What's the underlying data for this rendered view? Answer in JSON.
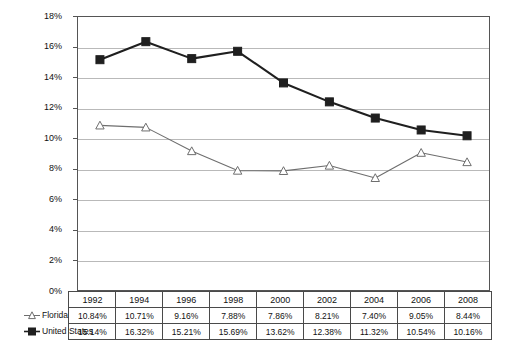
{
  "chart_data": {
    "type": "line",
    "title": "",
    "subtitle": "",
    "xlabel": "",
    "ylabel": "",
    "categories": [
      "1992",
      "1994",
      "1996",
      "1998",
      "2000",
      "2002",
      "2004",
      "2006",
      "2008"
    ],
    "series": [
      {
        "name": "Florida",
        "marker": "open-triangle",
        "color": "#6e6e6e",
        "values": [
          10.84,
          10.71,
          9.16,
          7.88,
          7.86,
          8.21,
          7.4,
          9.05,
          8.44
        ],
        "labels": [
          "10.84%",
          "10.71%",
          "9.16%",
          "7.88%",
          "7.86%",
          "8.21%",
          "7.40%",
          "9.05%",
          "8.44%"
        ]
      },
      {
        "name": "United States",
        "marker": "filled-square",
        "color": "#1f1f1f",
        "values": [
          15.14,
          16.32,
          15.21,
          15.69,
          13.62,
          12.38,
          11.32,
          10.54,
          10.16
        ],
        "labels": [
          "15.14%",
          "16.32%",
          "15.21%",
          "15.69%",
          "13.62%",
          "12.38%",
          "11.32%",
          "10.54%",
          "10.16%"
        ]
      }
    ],
    "ylim": [
      0,
      18
    ],
    "yticks": [
      0,
      2,
      4,
      6,
      8,
      10,
      12,
      14,
      16,
      18
    ],
    "ytick_labels": [
      "0%",
      "2%",
      "4%",
      "6%",
      "8%",
      "10%",
      "12%",
      "14%",
      "16%",
      "18%"
    ],
    "grid": true,
    "legend_position": "data-table-left",
    "value_suffix": "%"
  },
  "table": {
    "header_blank": "",
    "row_labels": [
      "Florida",
      "United States"
    ]
  },
  "colors": {
    "grid": "#b9b9b9",
    "axis": "#555555",
    "table_border": "#4a4a4a",
    "series_florida": "#6e6e6e",
    "series_us": "#1f1f1f",
    "background": "#ffffff"
  }
}
